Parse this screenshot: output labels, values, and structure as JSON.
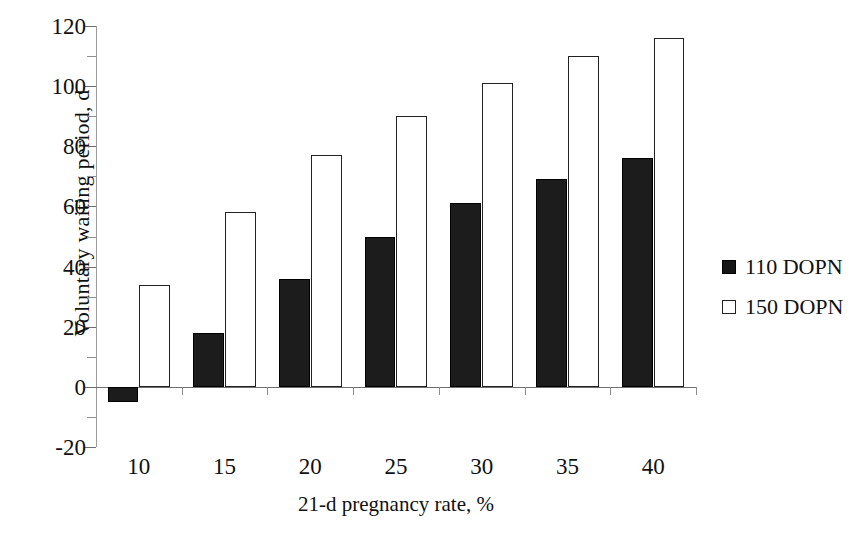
{
  "chart_data": {
    "type": "bar",
    "title": "",
    "xlabel": "21-d pregnancy rate, %",
    "ylabel": "Voluntary waiting period, d",
    "categories": [
      "10",
      "15",
      "20",
      "25",
      "30",
      "35",
      "40"
    ],
    "series": [
      {
        "name": "110 DOPN",
        "style": "filled",
        "color": "#1c1c1c",
        "values": [
          -5,
          18,
          36,
          50,
          61,
          69,
          76
        ]
      },
      {
        "name": "150 DOPN",
        "style": "open",
        "color": "#ffffff",
        "values": [
          34,
          58,
          77,
          90,
          101,
          110,
          116
        ]
      }
    ],
    "ylim": [
      -20,
      120
    ],
    "yticks": [
      -20,
      0,
      20,
      40,
      60,
      80,
      100,
      120
    ],
    "ytick_labels": [
      "-20",
      "0",
      "20",
      "40",
      "60",
      "80",
      "100",
      "120"
    ],
    "ytick_minor_step": 10,
    "grid": false,
    "legend_position": "right"
  },
  "legend": {
    "entries": [
      {
        "label": "110 DOPN",
        "swatch": "filled-square"
      },
      {
        "label": "150 DOPN",
        "swatch": "open-square"
      }
    ]
  },
  "axes": {
    "y_title": "Voluntary waiting period, d",
    "x_title": "21-d pregnancy rate, %"
  }
}
